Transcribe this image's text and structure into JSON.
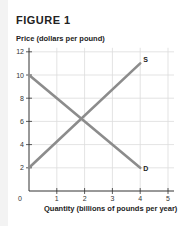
{
  "figure": {
    "title": "FIGURE 1"
  },
  "chart_data": {
    "type": "line",
    "title": "FIGURE 1",
    "xlabel": "Quantity (billions of pounds per year)",
    "ylabel": "Price (dollars per pound)",
    "xlim": [
      0,
      5
    ],
    "ylim": [
      0,
      12
    ],
    "x_ticks": [
      1,
      2,
      3,
      4,
      5
    ],
    "y_ticks": [
      2,
      4,
      6,
      8,
      10,
      12
    ],
    "origin_label": "0",
    "grid": true,
    "series": [
      {
        "name": "S",
        "label": "S",
        "points": [
          [
            0,
            2
          ],
          [
            4,
            11
          ]
        ]
      },
      {
        "name": "D",
        "label": "D",
        "points": [
          [
            0,
            10
          ],
          [
            4,
            2
          ]
        ]
      }
    ],
    "equilibrium": {
      "x": 2,
      "y": 6
    },
    "colors": {
      "curve": "#8c8c8c",
      "grid": "#dcdcdc",
      "axis": "#333333"
    }
  }
}
